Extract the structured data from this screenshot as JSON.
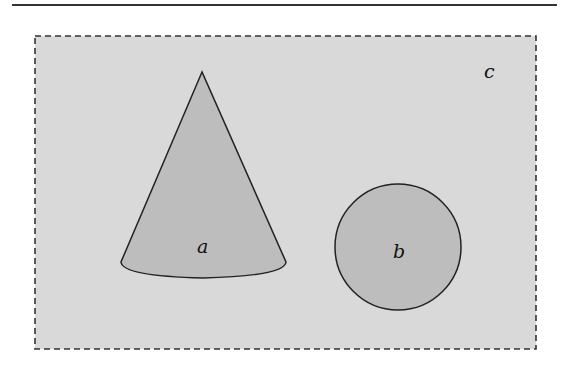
{
  "diagram": {
    "background_color": "#d9d9d9",
    "shape_fill_color": "#bdbdbd",
    "stroke_color": "#222222",
    "region": {
      "label": "c",
      "style": "dashed-rectangle"
    },
    "shapes": [
      {
        "id": "cone",
        "label": "a",
        "type": "cone"
      },
      {
        "id": "circle",
        "label": "b",
        "type": "circle"
      }
    ]
  }
}
